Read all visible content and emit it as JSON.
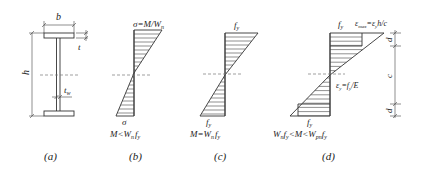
{
  "figure": {
    "panels": [
      {
        "id": "a",
        "caption": "(a)",
        "description": "I-section cross-section",
        "labels": {
          "flange_width": "b",
          "height": "h",
          "flange_thickness": "t",
          "web_thickness": "t",
          "web_thickness_sub": "w"
        }
      },
      {
        "id": "b",
        "caption": "(b)",
        "description": "Elastic stress distribution",
        "top_label": "σ=M/W",
        "top_label_sub": "n",
        "bottom_label": "σ",
        "condition": {
          "pre": "M<W",
          "sub1": "n",
          "mid": "f",
          "sub2": "y"
        }
      },
      {
        "id": "c",
        "caption": "(c)",
        "description": "Edge yield stress distribution",
        "top_label": "f",
        "top_label_sub": "y",
        "bottom_label": "f",
        "bottom_label_sub": "y",
        "condition": {
          "pre": "M=W",
          "sub1": "n",
          "mid": "f",
          "sub2": "y"
        }
      },
      {
        "id": "d",
        "caption": "(d)",
        "description": "Elastic-plastic stress distribution",
        "top_label": "f",
        "top_label_sub": "y",
        "strain_label": {
          "pre": "ε",
          "sub1": "max",
          "mid": "=ε",
          "sub2": "y",
          "post": "h/c"
        },
        "yield_strain": {
          "pre": "ε",
          "sub1": "y",
          "mid": "=f",
          "sub2": "y",
          "post": "/E"
        },
        "bottom_label": "f",
        "bottom_label_sub": "y",
        "dimensions": {
          "top_plastic": "d",
          "elastic_core": "c",
          "bottom_plastic": "d"
        },
        "condition": {
          "p1": "W",
          "s1": "n",
          "p2": "f",
          "s2": "y",
          "p3": "<M<W",
          "s3": "pn",
          "p4": "f",
          "s4": "y"
        }
      }
    ]
  }
}
